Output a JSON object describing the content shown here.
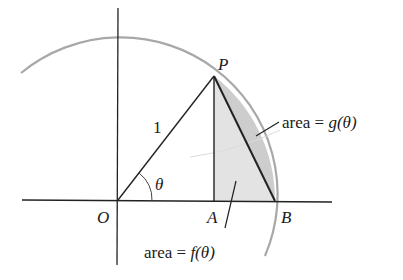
{
  "diagram": {
    "type": "unit-circle-sector",
    "points": {
      "O": {
        "label": "O"
      },
      "P": {
        "label": "P"
      },
      "A": {
        "label": "A"
      },
      "B": {
        "label": "B"
      }
    },
    "radius_label": "1",
    "angle_label": "θ",
    "annotations": {
      "g_prefix": "area = ",
      "g_func": "g(θ)",
      "f_prefix": "area = ",
      "f_func": "f(θ)"
    },
    "colors": {
      "arc": "#a8a8a8",
      "lines": "#222222",
      "shade_triangle": "#e2e2e2",
      "shade_segment": "#cfcfcf"
    }
  }
}
